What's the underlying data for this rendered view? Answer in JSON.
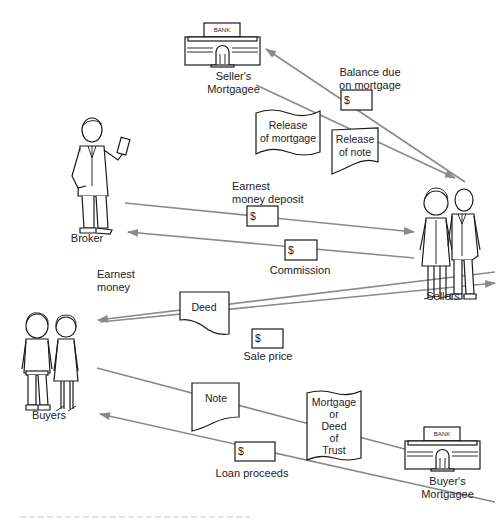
{
  "diagram": {
    "parties": {
      "sellers_mortgagee": {
        "label_line1": "Seller's",
        "label_line2": "Mortgagee",
        "bank_sign": "BANK"
      },
      "broker": {
        "label": "Broker"
      },
      "sellers": {
        "label": "Sellers"
      },
      "buyers": {
        "label": "Buyers"
      },
      "buyers_mortgagee": {
        "label_line1": "Buyer's",
        "label_line2": "Mortgagee",
        "bank_sign": "BANK"
      }
    },
    "flows": {
      "balance_due": {
        "label_line1": "Balance due",
        "label_line2": "on mortgage",
        "symbol": "$",
        "from": "Sellers",
        "to": "Seller's Mortgagee"
      },
      "release_of_mortgage": {
        "line1": "Release",
        "line2": "of mortgage",
        "from": "Seller's Mortgagee",
        "to": "Sellers"
      },
      "release_of_note": {
        "line1": "Release",
        "line2": "of note",
        "from": "Seller's Mortgagee",
        "to": "Sellers"
      },
      "earnest_money_deposit": {
        "label_line1": "Earnest",
        "label_line2": "money deposit",
        "symbol": "$",
        "from": "Broker",
        "to": "Sellers"
      },
      "commission": {
        "label": "Commission",
        "symbol": "$",
        "from": "Sellers",
        "to": "Broker"
      },
      "earnest_money": {
        "label_line1": "Earnest",
        "label_line2": "money"
      },
      "deed": {
        "label": "Deed",
        "from": "Sellers",
        "to": "Buyers"
      },
      "sale_price": {
        "label": "Sale price",
        "symbol": "$",
        "from": "Buyers",
        "to": "Sellers"
      },
      "note": {
        "label": "Note",
        "from": "Buyers",
        "to": "Buyer's Mortgagee"
      },
      "mortgage_or_deed": {
        "lines": [
          "Mortgage",
          "or",
          "Deed",
          "of",
          "Trust"
        ],
        "from": "Buyers",
        "to": "Buyer's Mortgagee"
      },
      "loan_proceeds": {
        "label": "Loan proceeds",
        "symbol": "$",
        "from": "Buyer's Mortgagee",
        "to": "Buyers"
      }
    },
    "colors": {
      "flow_line": "#8a8a8a",
      "ink": "#1a1a1a",
      "background": "#ffffff"
    }
  }
}
